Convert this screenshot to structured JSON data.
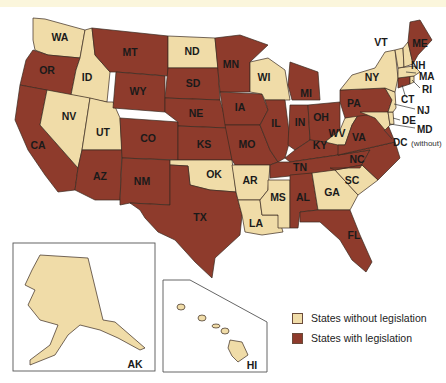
{
  "colors": {
    "without": "#f0dca8",
    "with": "#8e3b2c",
    "water": "#ffffff",
    "background": "#ffffff"
  },
  "legend": {
    "items": [
      {
        "label": "States without legislation",
        "color": "#f0dca8"
      },
      {
        "label": "States with legislation",
        "color": "#8e3b2c"
      }
    ]
  },
  "states_without_legislation": [
    "WA",
    "ID",
    "NV",
    "UT",
    "ND",
    "WI",
    "OK",
    "AR",
    "LA",
    "MS",
    "GA",
    "SC",
    "WV",
    "NY",
    "VT",
    "NH",
    "MA",
    "RI",
    "CT",
    "NJ",
    "DE",
    "MD",
    "AK",
    "HI"
  ],
  "states_with_legislation": [
    "OR",
    "CA",
    "MT",
    "WY",
    "CO",
    "AZ",
    "NM",
    "SD",
    "NE",
    "KS",
    "TX",
    "MN",
    "IA",
    "MO",
    "IL",
    "IN",
    "MI",
    "OH",
    "KY",
    "TN",
    "AL",
    "FL",
    "PA",
    "VA",
    "NC",
    "ME"
  ],
  "labels": {
    "WA": "WA",
    "OR": "OR",
    "CA": "CA",
    "ID": "ID",
    "NV": "NV",
    "UT": "UT",
    "AZ": "AZ",
    "MT": "MT",
    "WY": "WY",
    "CO": "CO",
    "NM": "NM",
    "ND": "ND",
    "SD": "SD",
    "NE": "NE",
    "KS": "KS",
    "OK": "OK",
    "TX": "TX",
    "MN": "MN",
    "IA": "IA",
    "MO": "MO",
    "AR": "AR",
    "LA": "LA",
    "WI": "WI",
    "IL": "IL",
    "MS": "MS",
    "MI": "MI",
    "IN": "IN",
    "KY": "KY",
    "TN": "TN",
    "AL": "AL",
    "OH": "OH",
    "WV": "WV",
    "GA": "GA",
    "FL": "FL",
    "SC": "SC",
    "NC": "NC",
    "VA": "VA",
    "PA": "PA",
    "NY": "NY",
    "VT": "VT",
    "ME": "ME",
    "NH": "NH",
    "MA": "MA",
    "RI": "RI",
    "CT": "CT",
    "NJ": "NJ",
    "DE": "DE",
    "MD": "MD",
    "DC": "DC",
    "DC_note": "(without)",
    "AK": "AK",
    "HI": "HI"
  }
}
